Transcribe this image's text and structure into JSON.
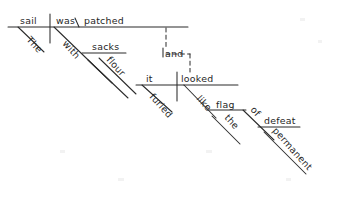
{
  "diagram": {
    "type": "reed-kellogg-sentence-diagram",
    "sentence": "The sail was patched with sacks of flour, and it looked like the furled flag of permanent defeat.",
    "ink_color": "#2b2b2b",
    "background_color": "#ffffff",
    "clauses": [
      {
        "id": "clause-1",
        "subject": "sail",
        "verb": "was",
        "complement": "patched",
        "modifiers": [
          "The",
          "with",
          "sacks",
          "of",
          "flour"
        ]
      },
      {
        "id": "clause-2",
        "subject": "it",
        "verb": "looked",
        "complement": "like",
        "modifiers": [
          "furled",
          "the",
          "flag",
          "of",
          "defeat",
          "permanent"
        ]
      }
    ],
    "conjunction": "and",
    "words": {
      "the_1": {
        "text": "The",
        "x": 26,
        "y": 40,
        "rot": 48
      },
      "sail": {
        "text": "sail",
        "x": 20,
        "y": 24,
        "rot": 0
      },
      "was": {
        "text": "was",
        "x": 56,
        "y": 24,
        "rot": 0
      },
      "patched": {
        "text": "patched",
        "x": 84,
        "y": 24,
        "rot": 0
      },
      "with": {
        "text": "with",
        "x": 62,
        "y": 44,
        "rot": 48
      },
      "sacks": {
        "text": "sacks",
        "x": 92,
        "y": 50,
        "rot": 0
      },
      "of_1": {
        "text": "",
        "x": 92,
        "y": 58,
        "rot": 48
      },
      "flour": {
        "text": "flour",
        "x": 106,
        "y": 60,
        "rot": 48
      },
      "and": {
        "text": "and",
        "x": 163,
        "y": 55,
        "rot": 0
      },
      "it": {
        "text": "it",
        "x": 143,
        "y": 82,
        "rot": 0
      },
      "furled": {
        "text": "furled",
        "x": 149,
        "y": 97,
        "rot": 48
      },
      "looked": {
        "text": "looked",
        "x": 181,
        "y": 82,
        "rot": 0
      },
      "like": {
        "text": "like",
        "x": 196,
        "y": 99,
        "rot": 48
      },
      "flag": {
        "text": "flag",
        "x": 218,
        "y": 108,
        "rot": 0
      },
      "the_2": {
        "text": "the",
        "x": 226,
        "y": 116,
        "rot": 48
      },
      "of_2": {
        "text": "of",
        "x": 251,
        "y": 110,
        "rot": 48
      },
      "defeat": {
        "text": "defeat",
        "x": 266,
        "y": 124,
        "rot": 0
      },
      "permanent": {
        "text": "permanent",
        "x": 276,
        "y": 131,
        "rot": 48
      }
    }
  }
}
